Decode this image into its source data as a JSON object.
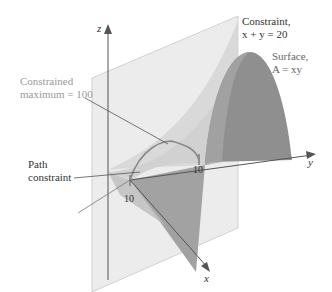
{
  "diagram": {
    "axes": {
      "x_label": "x",
      "y_label": "y",
      "z_label": "z",
      "x_tick": "10",
      "y_tick": "10"
    },
    "labels": {
      "constraint_line1": "Constraint,",
      "constraint_line2": "x + y = 20",
      "surface_line1": "Surface,",
      "surface_line2": "A = xy",
      "max_line1": "Constrained",
      "max_line2": "maximum = 100",
      "path_line1": "Path",
      "path_line2": "constraint"
    },
    "colors": {
      "plane": "#ececec",
      "plane_edge": "#c8c8c8",
      "surface_dark": "#8c8c8c",
      "surface_mid": "#a8a8a8",
      "surface_light": "#d4d4d4",
      "axis": "#555555",
      "curve": "#8a8a8a",
      "text_dark": "#333333",
      "text_light": "#9a9a9a"
    }
  }
}
